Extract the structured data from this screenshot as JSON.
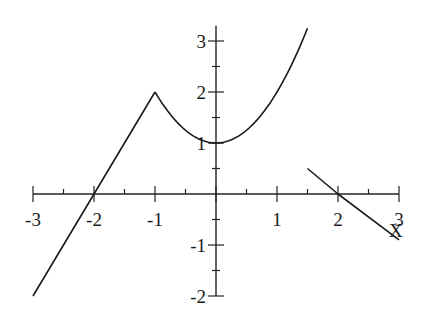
{
  "chart_data": {
    "type": "line",
    "title": "",
    "xlabel": "X",
    "ylabel": "",
    "xlim": [
      -3,
      3
    ],
    "ylim": [
      -2,
      3.3
    ],
    "grid": false,
    "legend": null,
    "x_ticks": {
      "major": [
        -3,
        -2,
        -1,
        0,
        1,
        2,
        3
      ],
      "labels": [
        "-3",
        "-2",
        "-1",
        "",
        "1",
        "2",
        "3"
      ],
      "minor_step": 0.5
    },
    "y_ticks": {
      "major": [
        -2,
        -1,
        0,
        1,
        2,
        3
      ],
      "labels": [
        "-2",
        "-1",
        "",
        "1",
        "2",
        "3"
      ],
      "minor_step": 0.5
    },
    "series": [
      {
        "name": "segment-linear-left",
        "formula": "y = 2x + 4",
        "x": [
          -3,
          -2,
          -1
        ],
        "y": [
          -2,
          0,
          2
        ]
      },
      {
        "name": "segment-parabola",
        "formula": "y = x^2 + 1",
        "x": [
          -1,
          -0.5,
          0,
          0.5,
          1,
          1.5
        ],
        "y": [
          2,
          1.25,
          1,
          1.25,
          2,
          3.25
        ]
      },
      {
        "name": "segment-linear-right",
        "formula": "y = 2 - x",
        "x": [
          1.5,
          2,
          3
        ],
        "y": [
          0.5,
          0,
          -0.9
        ]
      }
    ]
  },
  "layout": {
    "origin_px": [
      216,
      194
    ],
    "px_per_x": 61,
    "px_per_y": 51,
    "y_axis_top_y": 3.3
  }
}
